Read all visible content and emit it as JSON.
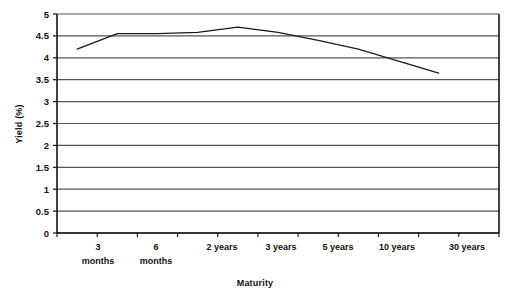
{
  "chart_data": {
    "type": "line",
    "title": "",
    "xlabel": "Maturity",
    "ylabel": "Yield (%)",
    "ylim": [
      0,
      5
    ],
    "ytick_labels": [
      "0",
      "0.5",
      "1",
      "1.5",
      "2",
      "2.5",
      "3",
      "3.5",
      "4",
      "4.5",
      "5"
    ],
    "ytick_values": [
      0,
      0.5,
      1,
      1.5,
      2,
      2.5,
      3,
      3.5,
      4,
      4.5,
      5
    ],
    "grid": true,
    "grid_axis": "y",
    "legend": "none",
    "categories": [
      "3 months",
      "6 months",
      "",
      "2 years",
      "3 years",
      "5 years",
      "10 years",
      "",
      "30 years"
    ],
    "x_positions": [
      0.5,
      1.5,
      2.5,
      3.5,
      4.5,
      5.5,
      6.5,
      7.5,
      9.5
    ],
    "x_axis_ticks": 11,
    "series": [
      {
        "name": "Yield curve",
        "color": "#1a1a1a",
        "values": [
          4.2,
          4.55,
          4.55,
          4.58,
          4.7,
          4.58,
          4.4,
          4.2,
          3.65
        ]
      }
    ],
    "x_tick_labels_line1": [
      "3",
      "6",
      "2 years",
      "3 years",
      "5 years",
      "10 years",
      "30 years"
    ],
    "x_tick_labels_line2": [
      "months",
      "months",
      "",
      "",
      "",
      "",
      ""
    ]
  },
  "labels": {
    "y_axis_title": "Yield (%)",
    "x_axis_title": "Maturity",
    "x_categories": [
      {
        "line1": "3",
        "line2": "months",
        "x": 98
      },
      {
        "line1": "6",
        "line2": "months",
        "x": 156
      },
      {
        "line1": "2 years",
        "line2": "",
        "x": 222
      },
      {
        "line1": "3 years",
        "line2": "",
        "x": 281
      },
      {
        "line1": "5 years",
        "line2": "",
        "x": 338
      },
      {
        "line1": "10 years",
        "line2": "",
        "x": 397
      },
      {
        "line1": "30 years",
        "line2": "",
        "x": 467
      }
    ]
  },
  "colors": {
    "line": "#1a1a1a",
    "grid": "#555555",
    "axis": "#111111",
    "background": "#ffffff"
  }
}
